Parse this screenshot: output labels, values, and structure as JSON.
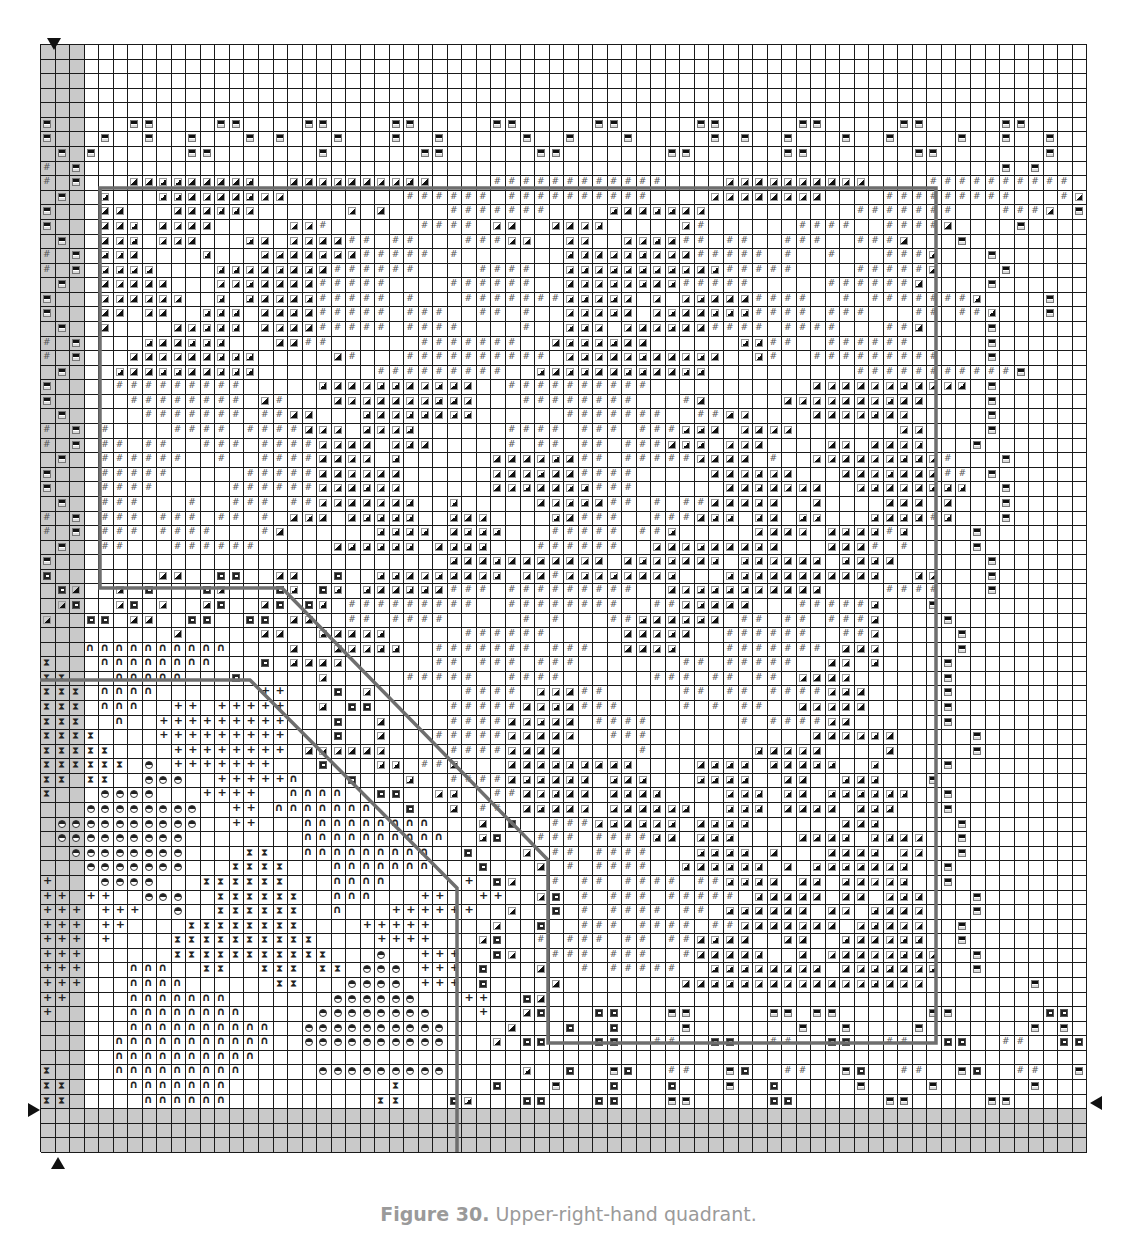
{
  "caption": {
    "label": "Figure 30.",
    "text": " Upper-right-hand quadrant."
  },
  "grid": {
    "cols": 72,
    "rows": 76,
    "shade_cols": [
      0,
      1,
      2
    ],
    "shade_rows": [
      73,
      74,
      75
    ],
    "legend": {
      ".": "blank",
      "T": "triangle-symbol",
      "#": "hash-symbol",
      "D": "dash-box-symbol",
      "C": "c-box-symbol",
      "A": "arch-symbol",
      "H": "hourglass-symbol",
      "+": "plus-symbol",
      "O": "half-circle-symbol"
    },
    "rows_data": [
      "........................................................................",
      "........................................................................",
      "........................................................................",
      "........................................................................",
      "........................................................................",
      "D.....DD....DD....DD....DD.....DD.....DD.....DD.....DD.....DD.....DD....",
      "D...D..D..D...D.D...D...D..D.....D..D...D.....D.D..D...D..D....D..D..D..",
      ".D.D......DD.......D......DD......DD.......DD......DD.......DD.......D...",
      "#.D...............................................................D.D...",
      "#.D...TTTTTTTTT..TTTTTTTTTT....############....TTTTTTTTTT....##########..D",
      ".D..T...TTTTTTTTT........######.##########....TTTTTTTT....#########...#T..",
      "D...TT...TTTTTT......T.T....#######....TTTTTTT..........#######...###T.D..",
      "D...TTT.TTTT.....TT#......####.TT..TTTT.....T#......####..####T....D....",
      ".D..TTT.TTT...TT.TTTT##.##...###TT..TT..TTTT##.##..###..###T...D.......",
      "#.D.TTT....T...TTTTTTT#####.#.......TTTTTTTTT#####.#..#...###T...D.....",
      "#.D.TTTT....TTTTTTTT######....####..TTTTTTTTTTT#####....#####T....D...",
      ".D..TTTTT...TTTTTTT#####....######..TTTTTTTT#####.....######T....D....",
      "D...TTTTTT..T.TTTTT#####.#...#######TTTTT.T.TTTTT####..#.#######T....D..",
      "D...TT.TT..TTT.TTTT#####.###..##.#..TTTTT.TTTTTTT####.###...##.##T...D..",
      ".D..T....TTTTT.TTTT#####.####....#..TTT.TTTTTT####.####...##T....D....",
      "#.D....TTTTTT...TT##......#######..TTTTTTT......TT##..######.....D...",
      "#.D...TTTTTTTTT.....T#...##########.TTTTTTTTTTT..T#..#########...D..",
      ".D...TTTTTTTTTT........#########..TTTTTTTTTTTT..........###########D...",
      "D....#########.....TTTTTTTTTTT..##########...........TTTTTTTTTTT.D...",
      "D.....########.T#...TTTTTTTTTT...########...#T.....TTTTTTTTTT....D...",
      ".D.....#######.##TT...TTTTTTTT......#######..##TT....TTTTTTT.....D..",
      "#.D.#....####.####TTT.TTTT......####.###.###TTT.TTTT.......TT....D.",
      "#.D.##.##..###.####TTTT.TTT.....#.##.##.###TTT.TTT....TT.TTTT...D..",
      ".D..######..#..####TTTT.T......TTTTTT##.#####TTTT.#..TTTTTTTTT#...D.",
      "D...#####.....#####TTTTTT......TTTTTT####.....TTTTTT...TTTTTTT##.D..",
      "D...####.....######TTTTTT......TTTTTTT###......TTTTTTT..TTTTTTTT..D.",
      ".D..###...#..###.##TTTTTTT..T.....TTTTT##.#.##TTTTT..T....TTT.T...D.",
      "#.D.###.###.##.#.TTT.TTTTT..TTT....TT###..###TTT.TT.TT...TTTT#T...D.",
      "#.D.###.####...#T......TTTT.TTTT...#####.##T.....TTTT.TTTT#T....D..",
      ".D..##...######.....TTTTTT.TTTT...######..TTTTTTTTT...TTT#.#....D..",
      "D...........................TTTTTTTTTTT.TTTTTTT.TTTTTT.TTTT......D..",
      "C.......TT..CC..TT..C..TTTTTTTTT.TT#TTTTTTTT...TTTTTTTTTTT..TT...D..",
      ".CT..T.C...CT...CT.CT.TTTTTT###.#########..TTTTTTTTTTT....####...D.",
      ".TC..TC.T..TC..TC.CT.#########..########..##TTTTT...#####T...D....",
      "T..CC.TT..CC..CC.TT..##.####.....#.#...##TTTTTT.##.##.###T....D...",
      ".........T.....TT..TTTTT.....######.....TTTTT..######..##T.....D..",
      "...AAAAAAAAAA....T..TTTTT..#######.###..TTTT...#######.TTT.....D..",
      "H...AAAAAAAA...C.TTTT......##.###.###.......##.#####..TT.T....D...",
      "HH...AAAAA...C.....T.....#####..####......###.##.##.TTTT......D..",
      "HHH.AAAA.......++...C.T......####.TTT##.....##.##.####TTT.....D...",
      "HHH.AAA..++.+++++..T.CC.....#####TTTT###....#.#.##..TTTTT.....D..",
      "HHH..A..+++++++++...C..T....####TTTTT.####......#.####TT......D...",
      "HHHH....+++++++++...C..T...#####TTTTT..###...........TTTTTT.....D..",
      "HHHHH....++++++++.TTTTTT....####TTTT.....#.......TTTTT....T.....D...",
      "HHHHHH.O.+++++++...C...TT.##T...TTTTTTTTT....TTTT.TTTTT..T....D..",
      "HH.HH..OOO..+++++A...C...T..####TTTTTT.TTT...TTTT..TT..TTT...D...",
      "H...OOOO...++++..AAAA..CC..TT..##TTTTT.TTTT....TTT.TT.TTTTTT..D..",
      "...OOOOOOOO..++.AAAAAAA..C..T.##.TTTTT.TTTTTT..TTT.TTTT.TTT...D..",
      ".OOOOOOOOOO..++...AAAAAAAAA...T.C..###TTTTTT.TTTT......TTT.....D..",
      ".OOOOOOOOO........AAAAAAAAAA..TC..###.####TT.TTT....TTTT.TTTT..D...",
      "..OOOOOOOO....HH..AAAAAAAAA..C...T.##.####...TTTT.T...TTTT.TT..D...",
      "...OOOOOOO...HHHH...AAAAAAA...C...T.#.####..TTTTTT.T.TTTTTTT..D..",
      "+...OOOO...HHHHHH...AAAA.....+.CT..#.##.####.##TTTT.TT.TTTTT..D...",
      "++.++..OOO..HHHHHH..AAA...++..++..TC.#.###.#####.TTTTT.TT.TTT...D..",
      "+++.+++..O..HHHHHH..A...++++++..T..C.#.####.##.TTTTTT.TT.TTTT...D..",
      "+++.++....HHHHHHHH....+++++....T..C..###.####.##TTTTTTT.TTTTT..D...",
      "+++.+....HHHHHHHHHH....++++...TC..#.###.##.##TTTT..TT..TTTTTT..D..",
      "+++......HHHHHHHHHHH...O..+++..CT..###.###..#TTTTT..T.TTTTTTTT..D..",
      "+++...AAA..HH..HHH.HH.OOO.+++.C...T..#.#####..TTTTTTTT.TTTTTTT..D..",
      "+++...AAAA......HH...OOOO.+++.C....T........TTTTTTTTTTTTTTTTT.......D.",
      "++....AAAAAAA.......OOOOOO...++..CT.....................................",
      "+.....AAAAAAAA.....OOOOOOOO...+..TC...CC...DD.....DD.DD......DD......CC.",
      "......AAAAAAAAAA..OOOOOOOOOO....T...C..C....D.......D..D....D.......D.D.",
      ".....AAAAAAAAAAA..OOOOOOOOOO...T.CC...CC..##..CC..##..CC..##..CC..##..CC.",
      ".....AAAAAAAAAA.....................................................",
      "H....AAAAAAAAA.....OOOOOOOOO.....T..C..DC..##..DC..##..DC..##..DC..##..DD",
      "HH....AAAAAAA...........H......C...D...C...C...D..C.....D....D......D...",
      "HH.....AAAAAA..........HH...CT...CC...CC...DD.....CC......DD.....DD....."
    ]
  },
  "outlines": {
    "color": "#6e6e6e",
    "paths": [
      "M100,188 L936,188 L936,1043 L548,1043 L548,860 L282,588 L100,588 Z",
      "M40,680 L250,680 L457,888 L457,1152"
    ]
  },
  "markers": [
    {
      "name": "top-marker",
      "dir": "down",
      "x": 47,
      "y": 38
    },
    {
      "name": "bottom-marker",
      "dir": "up",
      "x": 51,
      "y": 1157
    },
    {
      "name": "left-marker",
      "dir": "right",
      "x": 28,
      "y": 1103
    },
    {
      "name": "right-marker",
      "dir": "left",
      "x": 1090,
      "y": 1096
    }
  ]
}
